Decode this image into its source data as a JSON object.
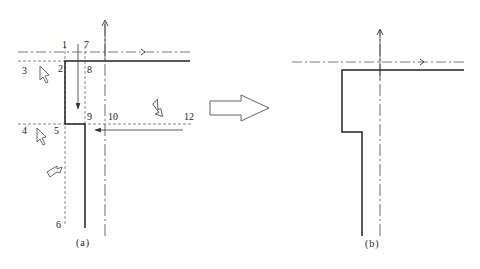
{
  "diagram": {
    "panel_a": {
      "caption": "(a)",
      "point_labels": [
        "1",
        "2",
        "3",
        "4",
        "5",
        "6",
        "7",
        "8",
        "9",
        "10",
        "12"
      ]
    },
    "panel_b": {
      "caption": "(b)"
    },
    "transition_arrow": "hollow-right-arrow",
    "colors": {
      "stroke": "#333333",
      "thick_edge": "#222222",
      "dashed": "#555555",
      "background": "#ffffff"
    }
  }
}
